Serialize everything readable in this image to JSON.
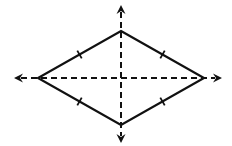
{
  "diagram": {
    "type": "rhombus-with-diagonals",
    "colors": {
      "stroke": "#111111",
      "background": "#ffffff"
    },
    "rhombus": {
      "vertices": {
        "top": [
          121,
          31
        ],
        "right": [
          204,
          78
        ],
        "bottom": [
          121,
          125
        ],
        "left": [
          38,
          78
        ]
      },
      "stroke_width": 2.2,
      "congruence_ticks_per_side": 1
    },
    "axes": {
      "horizontal": {
        "from": [
          14,
          78
        ],
        "to": [
          222,
          78
        ],
        "style": "dashed",
        "arrows": "both"
      },
      "vertical": {
        "from": [
          121,
          5
        ],
        "to": [
          121,
          143
        ],
        "style": "dashed",
        "arrows": "both"
      },
      "dash": "6,4",
      "stroke_width": 2
    }
  }
}
